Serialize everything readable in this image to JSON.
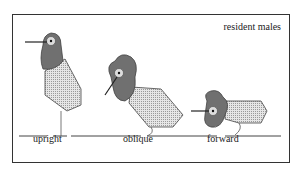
{
  "figure": {
    "title": "resident males",
    "postures": [
      {
        "label": "upright"
      },
      {
        "label": "oblique"
      },
      {
        "label": "forward"
      }
    ],
    "colors": {
      "body_fill": "#c8c8c8",
      "head_fill": "#707070",
      "stroke": "#333333"
    }
  }
}
